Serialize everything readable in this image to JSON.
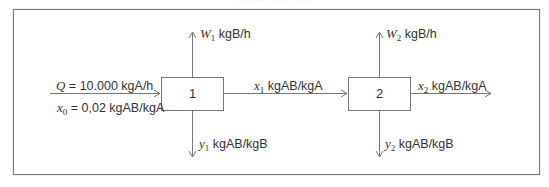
{
  "diagram": {
    "caption_partial": "················",
    "units": {
      "unit1": {
        "label": "1"
      },
      "unit2": {
        "label": "2"
      }
    },
    "streams": {
      "feed_flow": {
        "var": "Q",
        "rest": " = 10.000 kgA/h"
      },
      "feed_conc": {
        "var": "x",
        "sub": "0",
        "rest": " = 0,02 kgAB/kgA"
      },
      "solvent1": {
        "var": "W",
        "sub": "1",
        "rest": " kgB/h"
      },
      "extract1": {
        "var": "y",
        "sub": "1",
        "rest": " kgAB/kgB"
      },
      "raffinate1": {
        "var": "x",
        "sub": "1",
        "rest": " kgAB/kgA"
      },
      "solvent2": {
        "var": "W",
        "sub": "2",
        "rest": " kgB/h"
      },
      "raffinate2": {
        "var": "x",
        "sub": "2",
        "rest": " kgAB/kgA"
      },
      "extract2": {
        "var": "y",
        "sub": "2",
        "rest": " kgAB/kgB"
      }
    },
    "colors": {
      "line": "#777777",
      "text": "#333333",
      "frame": "#777777"
    }
  }
}
